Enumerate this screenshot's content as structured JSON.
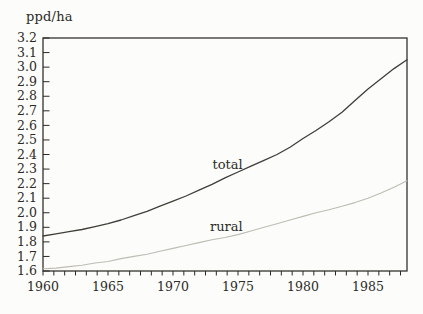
{
  "chart_data": {
    "type": "line",
    "title": "",
    "unit_label": "ppd/ha",
    "xlabel": "",
    "ylabel": "ppd/ha",
    "xlim": [
      1960,
      1988
    ],
    "ylim": [
      1.6,
      3.2
    ],
    "grid": false,
    "legend_position": "inline-labels",
    "x_tick_labels": [
      "1960",
      "1965",
      "1970",
      "1975",
      "1980",
      "1985"
    ],
    "x_minor_divisions_per_major": 6,
    "y_tick_labels": [
      "3.2",
      "3.1",
      "3.0",
      "2.9",
      "2.8",
      "2.7",
      "2.6",
      "2.5",
      "2.4",
      "2.3",
      "2.2",
      "2.1",
      "2.0",
      "1.9",
      "1.8",
      "1.7",
      "1.6"
    ],
    "x": [
      1960,
      1961,
      1962,
      1963,
      1964,
      1965,
      1966,
      1967,
      1968,
      1969,
      1970,
      1971,
      1972,
      1973,
      1974,
      1975,
      1976,
      1977,
      1978,
      1979,
      1980,
      1981,
      1982,
      1983,
      1984,
      1985,
      1986,
      1987,
      1988
    ],
    "series": [
      {
        "name": "total",
        "label": "total",
        "color": "#403e38",
        "stroke_width": 1.3,
        "values": [
          1.84,
          1.855,
          1.87,
          1.885,
          1.905,
          1.925,
          1.95,
          1.98,
          2.01,
          2.045,
          2.08,
          2.115,
          2.155,
          2.195,
          2.24,
          2.28,
          2.32,
          2.36,
          2.4,
          2.45,
          2.51,
          2.565,
          2.625,
          2.69,
          2.77,
          2.85,
          2.92,
          2.99,
          3.05
        ]
      },
      {
        "name": "rural",
        "label": "rural",
        "color": "#bdbcb4",
        "stroke_width": 1.1,
        "values": [
          1.615,
          1.62,
          1.63,
          1.64,
          1.655,
          1.665,
          1.685,
          1.7,
          1.715,
          1.735,
          1.755,
          1.775,
          1.795,
          1.815,
          1.83,
          1.85,
          1.875,
          1.9,
          1.925,
          1.95,
          1.975,
          2.0,
          2.02,
          2.045,
          2.07,
          2.1,
          2.135,
          2.175,
          2.22
        ]
      }
    ],
    "series_label_positions": [
      {
        "series": "total",
        "year": 1974.2,
        "value": 2.335
      },
      {
        "series": "rural",
        "year": 1974.1,
        "value": 1.907
      }
    ],
    "axis_color": "#2b2a26",
    "text_color": "#2b2a26",
    "background": "#fcfcfa"
  }
}
